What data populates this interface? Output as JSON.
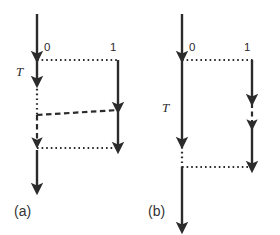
{
  "figure": {
    "kind": "timing-diagram",
    "width": 280,
    "height": 235,
    "background_color": "#ffffff",
    "stroke_color": "#2b2b2b",
    "panels": [
      {
        "id": "a",
        "caption": "(a)",
        "period_label": "T",
        "lane_labels": {
          "left": "0",
          "right": "1"
        }
      },
      {
        "id": "b",
        "caption": "(b)",
        "period_label": "T",
        "lane_labels": {
          "left": "0",
          "right": "1"
        }
      }
    ]
  },
  "panel_a": {
    "caption": "(a)",
    "period_label": "T",
    "label_zero": "0",
    "label_one": "1"
  },
  "panel_b": {
    "caption": "(b)",
    "period_label": "T",
    "label_zero": "0",
    "label_one": "1"
  }
}
